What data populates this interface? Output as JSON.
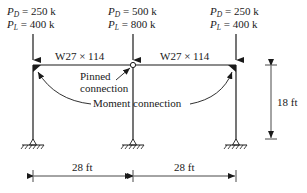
{
  "diagram": {
    "type": "structural-frame",
    "loads": [
      {
        "id": "left",
        "PD": "250 k",
        "PL": "400 k"
      },
      {
        "id": "middle",
        "PD": "500 k",
        "PL": "800 k"
      },
      {
        "id": "right",
        "PD": "250 k",
        "PL": "400 k"
      }
    ],
    "load_symbols": {
      "P": "P",
      "D": "D",
      "L": "L",
      "eq": " = "
    },
    "beams": [
      {
        "id": "left-beam",
        "label": "W27 × 114"
      },
      {
        "id": "right-beam",
        "label": "W27 × 114"
      }
    ],
    "annotations": {
      "pinned_line1": "Pinned",
      "pinned_line2": "connection",
      "moment": "Moment connection"
    },
    "dimensions": {
      "height": "18 ft",
      "span_left": "28 ft",
      "span_right": "28 ft"
    },
    "colors": {
      "line": "#1a1a1a",
      "background": "#ffffff"
    }
  }
}
